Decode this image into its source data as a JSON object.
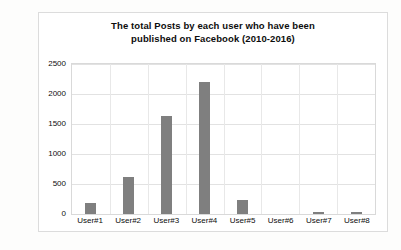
{
  "chart_data": {
    "type": "bar",
    "title": "The total Posts by each user who have been published on Facebook (2010-2016)",
    "title_line1": "The total Posts by each user who have been",
    "title_line2": "published on Facebook (2010-2016)",
    "categories": [
      "User#1",
      "User#2",
      "User#3",
      "User#4",
      "User#5",
      "User#6",
      "User#7",
      "User#8"
    ],
    "values": [
      185,
      620,
      1640,
      2200,
      240,
      0,
      35,
      40
    ],
    "xlabel": "",
    "ylabel": "",
    "ylim": [
      0,
      2500
    ],
    "ytick_step": 500,
    "yticks": [
      0,
      500,
      1000,
      1500,
      2000,
      2500
    ],
    "ytick_labels": [
      "0",
      "500",
      "1000",
      "1500",
      "2000",
      "2500"
    ],
    "grid": true,
    "legend": false,
    "bar_color": "#7f7f7f",
    "plot_background": "#ffffff",
    "gridline_color": "#e2e2e2"
  }
}
